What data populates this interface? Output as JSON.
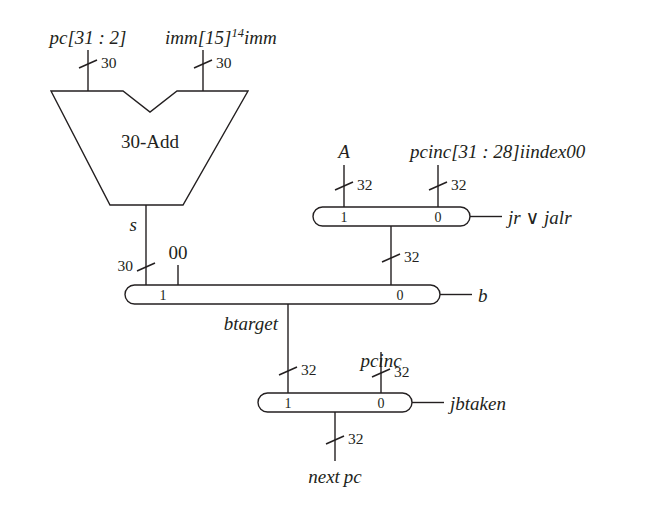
{
  "diagram": {
    "colors": {
      "ink": "#231f20",
      "background": "#ffffff"
    },
    "adder": {
      "label": "30-Add",
      "output_label": "s"
    },
    "inputs": {
      "pc_slice": "pc[31 : 2]",
      "imm_sign_ext_base": "imm[15]",
      "imm_sign_ext_sup": "14",
      "imm_sign_ext_tail": "imm",
      "a": "A",
      "jump_target": "pcinc[31 : 28]iindex00",
      "const_00": "00"
    },
    "widths": {
      "pc_w": "30",
      "imm_w": "30",
      "sum_w": "30",
      "a_w": "32",
      "jump_w": "32",
      "jr_out_w": "32",
      "btarget_w": "32",
      "pcinc_w": "32",
      "nextpc_w": "32"
    },
    "muxes": [
      {
        "name": "jr-jalr-mux",
        "port1": "1",
        "port0": "0",
        "select": "jr ∨ jalr"
      },
      {
        "name": "branch-mux",
        "port1": "1",
        "port0": "0",
        "select": "b"
      },
      {
        "name": "jbtaken-mux",
        "port1": "1",
        "port0": "0",
        "select": "jbtaken"
      }
    ],
    "signals": {
      "btarget": "btarget",
      "pcinc": "pcinc",
      "nextpc_prefix": "next",
      "nextpc_suffix": "pc"
    }
  }
}
